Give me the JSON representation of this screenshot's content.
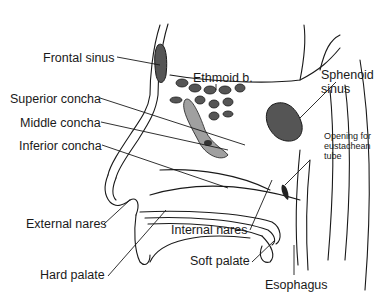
{
  "diagram": {
    "type": "anatomical-cross-section",
    "colors": {
      "line": "#1a1a1a",
      "sinus_fill": "#555555",
      "concha_fill": "#a0a0a0",
      "background": "#ffffff"
    },
    "labels": {
      "frontal_sinus": "Frontal sinus",
      "ethmoid": "Ethmoid b.",
      "sphenoid_1": "Sphenoid",
      "sphenoid_2": "sinus",
      "superior_concha": "Superior concha",
      "middle_concha": "Middle concha",
      "inferior_concha": "Inferior concha",
      "opening_1": "Opening for",
      "opening_2": "eustachean",
      "opening_3": "tube",
      "external_nares": "External nares",
      "internal_nares": "Internal nares",
      "hard_palate": "Hard palate",
      "soft_palate": "Soft palate",
      "esophagus": "Esophagus"
    }
  }
}
